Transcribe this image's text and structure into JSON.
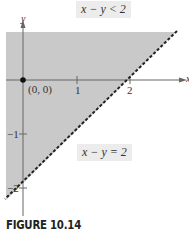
{
  "figure": {
    "caption": "FIGURE 10.14",
    "inequality_label": "x − y < 2",
    "boundary_label": "x − y = 2",
    "axis_x_label": "x",
    "axis_y_label": "y",
    "origin_label": "(0, 0)",
    "tick_x": [
      "1",
      "2"
    ],
    "tick_y": [
      "−1",
      "−2"
    ],
    "colors": {
      "shade": "#c8c8c8",
      "axis": "#555555",
      "boundary": "#222222"
    }
  }
}
